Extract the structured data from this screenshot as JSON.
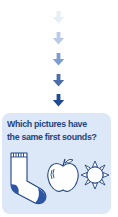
{
  "arrows": {
    "count": 5,
    "colors": [
      "#e6eef9",
      "#b9cbe6",
      "#7d9cd0",
      "#4a6ea8",
      "#1f4a94"
    ]
  },
  "question": {
    "line1": "Which pictures have",
    "line2": "the same first sounds?"
  },
  "pictures": [
    {
      "name": "sock",
      "icon": "sock-icon"
    },
    {
      "name": "apple",
      "icon": "apple-icon"
    },
    {
      "name": "sun",
      "icon": "sun-icon"
    }
  ],
  "colors": {
    "box_background": "#dce8f8",
    "text": "#1f4480",
    "outline": "#1f4480",
    "accent": "#2d57a6"
  }
}
